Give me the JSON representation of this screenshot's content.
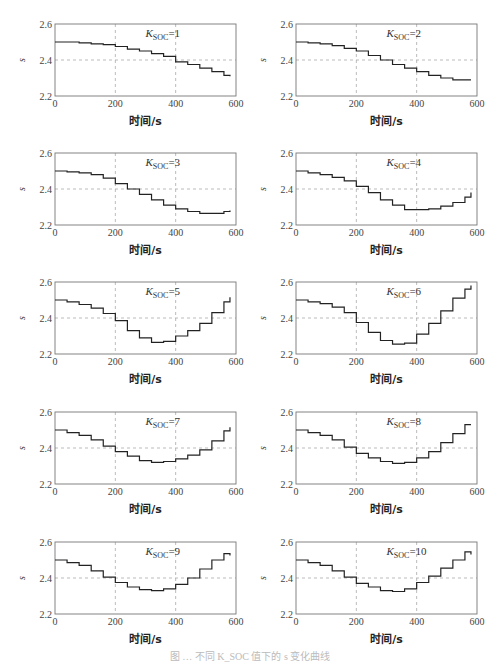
{
  "figure": {
    "caption": "图 … 不同 K_SOC 值下的 s 变化曲线"
  },
  "chart_data": [
    {
      "type": "line",
      "title": "K_SOC=1",
      "k": "1",
      "xlabel": "时间/s",
      "ylabel": "s",
      "xlim": [
        0,
        600
      ],
      "ylim": [
        2.2,
        2.6
      ],
      "xticks": [
        0,
        200,
        400,
        600
      ],
      "yticks": [
        2.2,
        2.4,
        2.6
      ],
      "grid": true,
      "step": true,
      "x": [
        0,
        40,
        80,
        120,
        160,
        200,
        240,
        280,
        320,
        360,
        400,
        440,
        480,
        520,
        560,
        580
      ],
      "values": [
        2.5,
        2.5,
        2.495,
        2.49,
        2.485,
        2.475,
        2.46,
        2.45,
        2.435,
        2.42,
        2.39,
        2.375,
        2.355,
        2.335,
        2.315,
        2.31
      ]
    },
    {
      "type": "line",
      "title": "K_SOC=2",
      "k": "2",
      "xlabel": "时间/s",
      "ylabel": "s",
      "xlim": [
        0,
        600
      ],
      "ylim": [
        2.2,
        2.6
      ],
      "xticks": [
        0,
        200,
        400,
        600
      ],
      "yticks": [
        2.2,
        2.4,
        2.6
      ],
      "grid": true,
      "step": true,
      "x": [
        0,
        40,
        80,
        120,
        160,
        200,
        240,
        280,
        320,
        360,
        400,
        440,
        480,
        520,
        560,
        580
      ],
      "values": [
        2.5,
        2.495,
        2.49,
        2.48,
        2.465,
        2.45,
        2.425,
        2.4,
        2.375,
        2.355,
        2.335,
        2.315,
        2.3,
        2.29,
        2.29,
        2.29
      ]
    },
    {
      "type": "line",
      "title": "K_SOC=3",
      "k": "3",
      "xlabel": "时间/s",
      "ylabel": "s",
      "xlim": [
        0,
        600
      ],
      "ylim": [
        2.2,
        2.6
      ],
      "xticks": [
        0,
        200,
        400,
        600
      ],
      "yticks": [
        2.2,
        2.4,
        2.6
      ],
      "grid": true,
      "step": true,
      "x": [
        0,
        40,
        80,
        120,
        160,
        200,
        240,
        280,
        320,
        360,
        400,
        440,
        480,
        520,
        560,
        580
      ],
      "values": [
        2.5,
        2.495,
        2.49,
        2.48,
        2.46,
        2.43,
        2.4,
        2.37,
        2.34,
        2.31,
        2.29,
        2.275,
        2.265,
        2.265,
        2.275,
        2.28
      ]
    },
    {
      "type": "line",
      "title": "K_SOC=4",
      "k": "4",
      "xlabel": "时间/s",
      "ylabel": "s",
      "xlim": [
        0,
        600
      ],
      "ylim": [
        2.2,
        2.6
      ],
      "xticks": [
        0,
        200,
        400,
        600
      ],
      "yticks": [
        2.2,
        2.4,
        2.6
      ],
      "grid": true,
      "step": true,
      "x": [
        0,
        40,
        80,
        120,
        160,
        200,
        240,
        280,
        320,
        360,
        400,
        440,
        480,
        520,
        560,
        580
      ],
      "values": [
        2.5,
        2.49,
        2.48,
        2.465,
        2.445,
        2.415,
        2.38,
        2.34,
        2.31,
        2.285,
        2.285,
        2.29,
        2.305,
        2.325,
        2.355,
        2.38
      ]
    },
    {
      "type": "line",
      "title": "K_SOC=5",
      "k": "5",
      "xlabel": "时间/s",
      "ylabel": "s",
      "xlim": [
        0,
        600
      ],
      "ylim": [
        2.2,
        2.6
      ],
      "xticks": [
        0,
        200,
        400,
        600
      ],
      "yticks": [
        2.2,
        2.4,
        2.6
      ],
      "grid": true,
      "step": true,
      "x": [
        0,
        40,
        80,
        120,
        160,
        200,
        240,
        280,
        320,
        360,
        400,
        440,
        480,
        520,
        560,
        580
      ],
      "values": [
        2.5,
        2.49,
        2.475,
        2.455,
        2.425,
        2.385,
        2.33,
        2.29,
        2.265,
        2.27,
        2.3,
        2.33,
        2.37,
        2.43,
        2.49,
        2.515
      ]
    },
    {
      "type": "line",
      "title": "K_SOC=6",
      "k": "6",
      "xlabel": "时间/s",
      "ylabel": "s",
      "xlim": [
        0,
        600
      ],
      "ylim": [
        2.2,
        2.6
      ],
      "xticks": [
        0,
        200,
        400,
        600
      ],
      "yticks": [
        2.2,
        2.4,
        2.6
      ],
      "grid": true,
      "step": true,
      "x": [
        0,
        40,
        80,
        120,
        160,
        200,
        240,
        280,
        320,
        360,
        400,
        440,
        480,
        520,
        560,
        580
      ],
      "values": [
        2.5,
        2.49,
        2.48,
        2.46,
        2.43,
        2.375,
        2.32,
        2.275,
        2.255,
        2.26,
        2.31,
        2.37,
        2.44,
        2.51,
        2.56,
        2.58
      ]
    },
    {
      "type": "line",
      "title": "K_SOC=7",
      "k": "7",
      "xlabel": "时间/s",
      "ylabel": "s",
      "xlim": [
        0,
        600
      ],
      "ylim": [
        2.2,
        2.6
      ],
      "xticks": [
        0,
        200,
        400,
        600
      ],
      "yticks": [
        2.2,
        2.4,
        2.6
      ],
      "grid": true,
      "step": true,
      "x": [
        0,
        40,
        80,
        120,
        160,
        200,
        240,
        280,
        320,
        360,
        400,
        440,
        480,
        520,
        560,
        580
      ],
      "values": [
        2.5,
        2.485,
        2.47,
        2.445,
        2.41,
        2.38,
        2.355,
        2.33,
        2.32,
        2.325,
        2.34,
        2.36,
        2.39,
        2.44,
        2.495,
        2.515
      ]
    },
    {
      "type": "line",
      "title": "K_SOC=8",
      "k": "8",
      "xlabel": "时间/s",
      "ylabel": "s",
      "xlim": [
        0,
        600
      ],
      "ylim": [
        2.2,
        2.6
      ],
      "xticks": [
        0,
        200,
        400,
        600
      ],
      "yticks": [
        2.2,
        2.4,
        2.6
      ],
      "grid": true,
      "step": true,
      "x": [
        0,
        40,
        80,
        120,
        160,
        200,
        240,
        280,
        320,
        360,
        400,
        440,
        480,
        520,
        560,
        580
      ],
      "values": [
        2.5,
        2.485,
        2.47,
        2.445,
        2.405,
        2.37,
        2.345,
        2.325,
        2.315,
        2.32,
        2.345,
        2.38,
        2.43,
        2.48,
        2.53,
        2.53
      ]
    },
    {
      "type": "line",
      "title": "K_SOC=9",
      "k": "9",
      "xlabel": "时间/s",
      "ylabel": "s",
      "xlim": [
        0,
        600
      ],
      "ylim": [
        2.2,
        2.6
      ],
      "xticks": [
        0,
        200,
        400,
        600
      ],
      "yticks": [
        2.2,
        2.4,
        2.6
      ],
      "grid": true,
      "step": true,
      "x": [
        0,
        40,
        80,
        120,
        160,
        200,
        240,
        280,
        320,
        360,
        400,
        440,
        480,
        520,
        560,
        580
      ],
      "values": [
        2.5,
        2.485,
        2.47,
        2.44,
        2.405,
        2.375,
        2.35,
        2.335,
        2.33,
        2.34,
        2.365,
        2.4,
        2.45,
        2.5,
        2.535,
        2.525
      ]
    },
    {
      "type": "line",
      "title": "K_SOC=10",
      "k": "10",
      "xlabel": "时间/s",
      "ylabel": "s",
      "xlim": [
        0,
        600
      ],
      "ylim": [
        2.2,
        2.6
      ],
      "xticks": [
        0,
        200,
        400,
        600
      ],
      "yticks": [
        2.2,
        2.4,
        2.6
      ],
      "grid": true,
      "step": true,
      "x": [
        0,
        40,
        80,
        120,
        160,
        200,
        240,
        280,
        320,
        360,
        400,
        440,
        480,
        520,
        560,
        580
      ],
      "values": [
        2.5,
        2.485,
        2.47,
        2.44,
        2.405,
        2.37,
        2.35,
        2.33,
        2.325,
        2.34,
        2.375,
        2.41,
        2.455,
        2.5,
        2.545,
        2.53
      ]
    }
  ]
}
